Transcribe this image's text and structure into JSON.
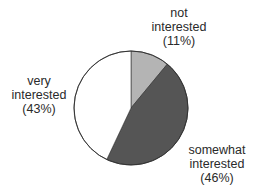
{
  "chart_data": {
    "type": "pie",
    "title": "",
    "start_angle_deg": 0,
    "direction": "clockwise",
    "slices": [
      {
        "name": "not interested",
        "value": 11,
        "label_lines": [
          "not",
          "interested",
          "(11%)"
        ],
        "color": "#b4b4b4"
      },
      {
        "name": "somewhat interested",
        "value": 46,
        "label_lines": [
          "somewhat",
          "interested",
          "(46%)"
        ],
        "color": "#555555"
      },
      {
        "name": "very interested",
        "value": 43,
        "label_lines": [
          "very",
          "interested",
          "(43%)"
        ],
        "color": "#ffffff"
      }
    ],
    "outline_color": "#333333",
    "center": [
      131,
      108
    ],
    "radius": 57
  }
}
